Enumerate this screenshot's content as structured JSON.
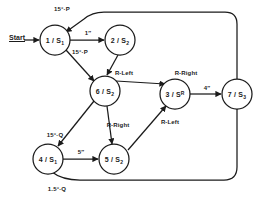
{
  "diagram": {
    "start_marker": "Start",
    "nodes": [
      {
        "id": "n1",
        "label_main": "1 / S",
        "label_sub": "1",
        "label_sup": "",
        "cx": 55,
        "cy": 40,
        "r": 15
      },
      {
        "id": "n2",
        "label_main": "2 / S",
        "label_sub": "2",
        "label_sup": "",
        "cx": 120,
        "cy": 40,
        "r": 15
      },
      {
        "id": "n6",
        "label_main": "6 / S",
        "label_sub": "2",
        "label_sup": "",
        "cx": 105,
        "cy": 91,
        "r": 15
      },
      {
        "id": "n3",
        "label_main": "3 / S",
        "label_sub": "",
        "label_sup": "R",
        "cx": 175,
        "cy": 94,
        "r": 15
      },
      {
        "id": "n7",
        "label_main": "7 / S",
        "label_sub": "3",
        "label_sup": "",
        "cx": 237,
        "cy": 94,
        "r": 15
      },
      {
        "id": "n4",
        "label_main": "4 / S",
        "label_sub": "1",
        "label_sup": "",
        "cx": 48,
        "cy": 159,
        "r": 15
      },
      {
        "id": "n5",
        "label_main": "5 / S",
        "label_sub": "2",
        "label_sup": "",
        "cx": 114,
        "cy": 159,
        "r": 15
      }
    ],
    "edge_labels": [
      {
        "id": "e-7-1",
        "text": "15°·P",
        "x": 62,
        "y": 9,
        "from": "n7",
        "to": "n1"
      },
      {
        "id": "e-1-2",
        "text": "1″",
        "x": 88,
        "y": 33,
        "from": "n1",
        "to": "n2"
      },
      {
        "id": "e-1-6",
        "text": "15°·P",
        "x": 80,
        "y": 52,
        "from": "n1",
        "to": "n6"
      },
      {
        "id": "e-2-6",
        "text": "R-Left",
        "x": 124,
        "y": 73,
        "from": "n2",
        "to": "n6"
      },
      {
        "id": "e-6-3",
        "text": "R-Right",
        "x": 186,
        "y": 73,
        "from": "n6",
        "to": "n3"
      },
      {
        "id": "e-6-5",
        "text": "R-Right",
        "x": 118,
        "y": 125,
        "from": "n6",
        "to": "n5"
      },
      {
        "id": "e-5-3",
        "text": "R-Left",
        "x": 170,
        "y": 122,
        "from": "n5",
        "to": "n3"
      },
      {
        "id": "e-3-7",
        "text": "4″",
        "x": 207,
        "y": 88,
        "from": "n3",
        "to": "n7"
      },
      {
        "id": "e-6-4",
        "text": "15°·Q",
        "x": 55,
        "y": 135,
        "from": "n6",
        "to": "n4"
      },
      {
        "id": "e-4-5",
        "text": "5″",
        "x": 81,
        "y": 152,
        "from": "n4",
        "to": "n5"
      },
      {
        "id": "e-7-4",
        "text": "1.5°·Q",
        "x": 57,
        "y": 189,
        "from": "n7",
        "to": "n4"
      }
    ],
    "start": {
      "x": 17,
      "y": 38
    },
    "colors": {
      "stroke": "#1b1b1b",
      "node_fill": "#ffffff",
      "background": "#ffffff",
      "text": "#1b1b1b"
    }
  }
}
